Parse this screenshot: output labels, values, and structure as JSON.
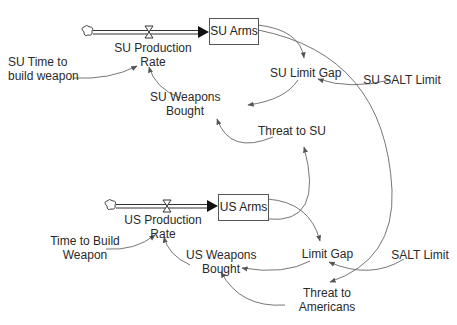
{
  "diagram": {
    "type": "stock-and-flow",
    "su": {
      "stock": "SU Arms",
      "flow": [
        "SU Production",
        "Rate"
      ],
      "time_to_build": [
        "SU Time to",
        "build weapon"
      ],
      "limit_gap": "SU Limit Gap",
      "salt_limit": "SU SALT Limit",
      "weapons_bought": [
        "SU Weapons",
        "Bought"
      ],
      "threat": "Threat to SU"
    },
    "us": {
      "stock": "US Arms",
      "flow": [
        "US Production",
        "Rate"
      ],
      "time_to_build": [
        "Time to Build",
        "Weapon"
      ],
      "limit_gap": "Limit Gap",
      "salt_limit": "SALT Limit",
      "weapons_bought": [
        "US Weapons",
        "Bought"
      ],
      "threat": [
        "Threat to",
        "Americans"
      ]
    },
    "links": [
      {
        "from": "SU Time to build weapon",
        "to": "SU Production Rate"
      },
      {
        "from": "SU Weapons Bought",
        "to": "SU Production Rate"
      },
      {
        "from": "SU Arms",
        "to": "SU Limit Gap"
      },
      {
        "from": "SU SALT Limit",
        "to": "SU Limit Gap"
      },
      {
        "from": "SU Limit Gap",
        "to": "SU Weapons Bought"
      },
      {
        "from": "Threat to SU",
        "to": "SU Weapons Bought"
      },
      {
        "from": "US Arms",
        "to": "Threat to SU"
      },
      {
        "from": "SU Arms",
        "to": "Threat to Americans"
      },
      {
        "from": "Time to Build Weapon",
        "to": "US Production Rate"
      },
      {
        "from": "US Weapons Bought",
        "to": "US Production Rate"
      },
      {
        "from": "US Arms",
        "to": "Limit Gap"
      },
      {
        "from": "SALT Limit",
        "to": "Limit Gap"
      },
      {
        "from": "Limit Gap",
        "to": "US Weapons Bought"
      },
      {
        "from": "Threat to Americans",
        "to": "US Weapons Bought"
      }
    ]
  }
}
